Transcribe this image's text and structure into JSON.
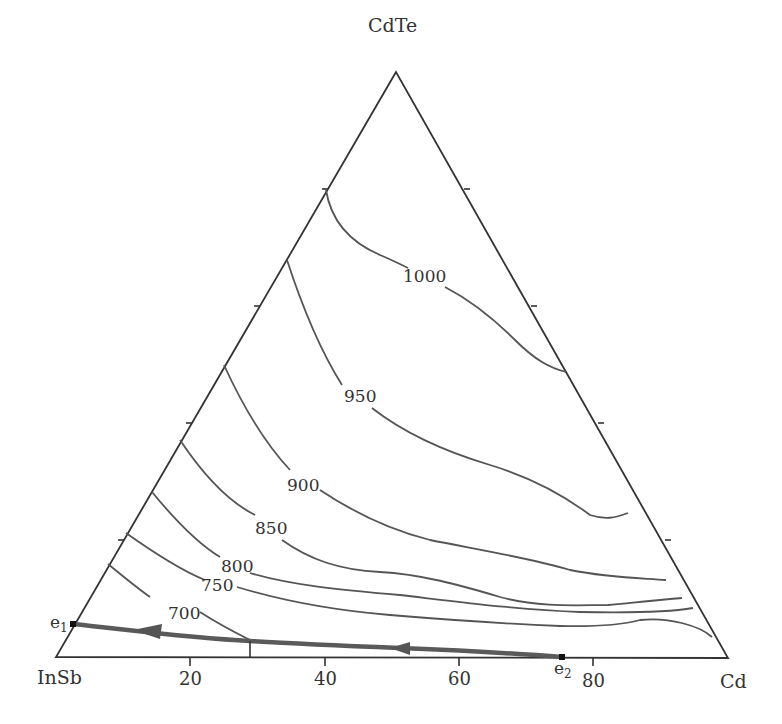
{
  "diagram": {
    "type": "ternary-liquidus-projection",
    "vertices": {
      "top": "CdTe",
      "left": "InSb",
      "right": "Cd"
    },
    "bottom_axis_ticks": [
      "20",
      "40",
      "60",
      "80"
    ],
    "isotherm_labels": [
      "1000",
      "950",
      "900",
      "850",
      "800",
      "750",
      "700"
    ],
    "points": {
      "e1": {
        "label": "e",
        "sub": "1"
      },
      "e2": {
        "label": "e",
        "sub": "2"
      }
    },
    "colors": {
      "lines": "#555555",
      "edges": "#333333",
      "eutectic_line": "#5a5a5a"
    }
  }
}
